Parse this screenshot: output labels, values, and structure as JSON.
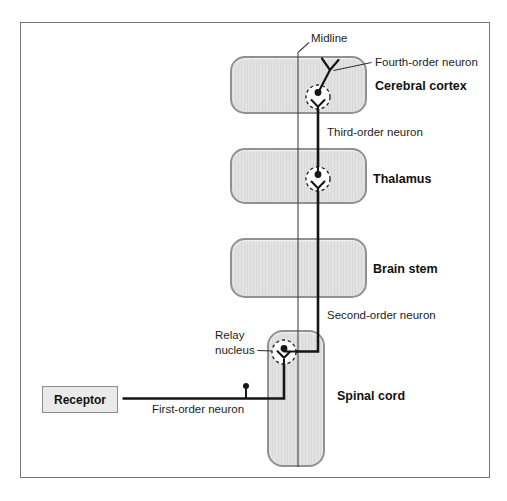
{
  "figure": {
    "title_semantics": "Somatosensory pathway diagram",
    "labels": {
      "midline": "Midline",
      "fourth_order": "Fourth-order neuron",
      "cerebral_cortex": "Cerebral cortex",
      "third_order": "Third-order neuron",
      "thalamus": "Thalamus",
      "brain_stem": "Brain stem",
      "second_order": "Second-order neuron",
      "relay_line1": "Relay",
      "relay_line2": "nucleus",
      "spinal_cord": "Spinal cord",
      "receptor": "Receptor",
      "first_order": "First-order neuron"
    },
    "colors": {
      "background": "#ffffff",
      "frame_border": "#777777",
      "region_fill": "#dedede",
      "region_border": "#919191",
      "neuron_line": "#161616",
      "midline_line": "#444444"
    }
  }
}
